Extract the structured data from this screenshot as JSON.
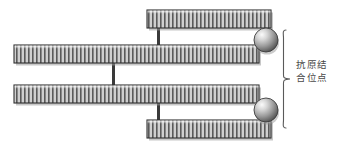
{
  "figure": {
    "type": "antibody-structure-diagram",
    "background_color": "#ffffff",
    "annotation": {
      "label": "抗原结\n合位点",
      "label_line1": "抗原结",
      "label_line2": "合位点",
      "meaning": "antigen binding site",
      "text_color": "#4a4a4a",
      "brace_color": "#5a5a5a"
    },
    "colors": {
      "chain_fill": "#c9c9c9",
      "chain_stripe": "#555555",
      "chain_border": "#333333",
      "chain_shadow": "#8c8c8c",
      "connector": "#3a3a3a",
      "sphere_light": "#f2f2f2",
      "sphere_mid": "#9a9a9a",
      "sphere_dark": "#4d4d4d",
      "sphere_border": "#3d3d3d"
    },
    "chains": [
      {
        "name": "light-chain-top",
        "x": 147,
        "y": 10,
        "width": 124,
        "height": 18
      },
      {
        "name": "heavy-chain-top",
        "x": 14,
        "y": 45,
        "width": 245,
        "height": 18
      },
      {
        "name": "heavy-chain-bottom",
        "x": 14,
        "y": 85,
        "width": 245,
        "height": 18
      },
      {
        "name": "light-chain-bottom",
        "x": 147,
        "y": 120,
        "width": 124,
        "height": 18
      }
    ],
    "connectors": [
      {
        "name": "disulfide-bond-top",
        "x": 158,
        "y1": 28,
        "y2": 45
      },
      {
        "name": "disulfide-bond-middle",
        "x": 113,
        "y1": 63,
        "y2": 85
      },
      {
        "name": "disulfide-bond-bottom",
        "x": 158,
        "y1": 103,
        "y2": 120
      }
    ],
    "binding_sites": [
      {
        "name": "antigen-binding-site-top",
        "cx": 266,
        "cy": 40,
        "r": 12
      },
      {
        "name": "antigen-binding-site-bottom",
        "cx": 266,
        "cy": 110,
        "r": 12
      }
    ],
    "brace": {
      "x": 283,
      "y_top": 30,
      "y_bottom": 128,
      "tip_x": 291,
      "mid_y": 79
    }
  }
}
